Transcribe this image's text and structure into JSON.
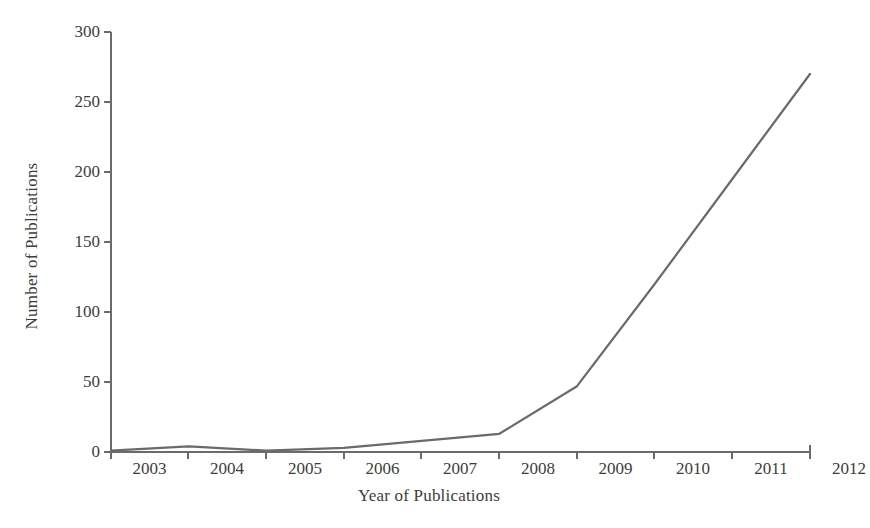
{
  "chart_data": {
    "type": "line",
    "title": "",
    "xlabel": "Year of Publications",
    "ylabel": "Number of Publications",
    "categories": [
      "2003",
      "2004",
      "2005",
      "2006",
      "2007",
      "2008",
      "2009",
      "2010",
      "2011",
      "2012"
    ],
    "x": [
      2003,
      2004,
      2005,
      2006,
      2007,
      2008,
      2009,
      2010,
      2011,
      2012
    ],
    "values": [
      1,
      4,
      1,
      3,
      8,
      13,
      47,
      120,
      195,
      270
    ],
    "series": [
      {
        "name": "Number of Publications",
        "values": [
          1,
          4,
          1,
          3,
          8,
          13,
          47,
          120,
          195,
          270
        ]
      }
    ],
    "ylim": [
      0,
      300
    ],
    "yticks": [
      0,
      50,
      100,
      150,
      200,
      250,
      300
    ],
    "ytick_labels": [
      "0",
      "50",
      "100",
      "150",
      "200",
      "250",
      "300"
    ],
    "xtick_labels": [
      "2003",
      "2004",
      "2005",
      "2006",
      "2007",
      "2008",
      "2009",
      "2010",
      "2011",
      "2012"
    ],
    "grid": false,
    "legend": "none",
    "line_color": "#6a6a6a",
    "axis_color": "#6b6b6b",
    "background_color": "#ffffff"
  }
}
